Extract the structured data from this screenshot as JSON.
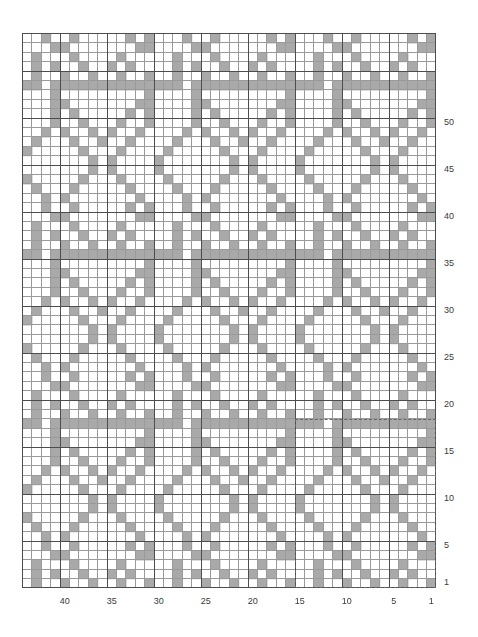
{
  "chart_data": {
    "type": "heatmap",
    "title": "",
    "subtitle": "",
    "xlabel": "",
    "ylabel": "",
    "grid": true,
    "legend_position": "none",
    "columns": 44,
    "rows": 59,
    "x_direction": "right-to-left",
    "y_direction": "bottom-to-top",
    "xlim": [
      1,
      44
    ],
    "ylim": [
      1,
      59
    ],
    "x_tick_labels": [
      "40",
      "35",
      "30",
      "25",
      "20",
      "15",
      "10",
      "5",
      "1"
    ],
    "x_tick_values": [
      40,
      35,
      30,
      25,
      20,
      15,
      10,
      5,
      1
    ],
    "y_tick_labels": [
      "50",
      "45",
      "40",
      "35",
      "30",
      "25",
      "20",
      "15",
      "10",
      "5",
      "1"
    ],
    "y_tick_values": [
      50,
      45,
      40,
      35,
      30,
      25,
      20,
      15,
      10,
      5,
      1
    ],
    "colors": {
      "filled_cell": "#a9a9a9",
      "empty_cell": "#ffffff",
      "cell_border": "#9a9a9a",
      "major_border": "#4d4d4d",
      "repeat_box": "#666666",
      "label_text": "#3a3a3a"
    },
    "cell_size_px": 9.4,
    "major_gridline_every": 5,
    "repeat": {
      "label": "pattern repeat",
      "col_start": 1,
      "col_end": 15,
      "row_start": 1,
      "row_end": 18,
      "width": 15,
      "height": 18,
      "style": "dashed"
    },
    "motif": {
      "width": 15,
      "height": 18,
      "note": "Tile repeated across the chart. Rows listed bottom (row 1) to top (row 18); each string is 15 characters, right-to-left column 1..15 reading left-to-right in the string is column 15..1. '#'=filled, '.'=empty.",
      "rows_bottom_to_top": [
        "#..#..#..#..#..",
        "..#.#..#..#.#..",
        "...#....#...#..",
        "##.......##....",
        "#.#.....#..#...",
        ".#.......#.#...",
        "..#.....#...#..",
        "...#...#.....#.",
        "....#.#.......#",
        "....#.#.......#",
        "...#...#.....#.",
        "..#..#..#...#..",
        ".#..#.#..#.#...",
        "#..#...#..#....",
        "#.#.....#.#....",
        "##.......##....",
        "#.........#....",
        "###########.###"
      ]
    }
  },
  "axes": {
    "right_row_labels": [
      "50",
      "45",
      "40",
      "35",
      "30",
      "25",
      "20",
      "15",
      "10",
      "5",
      "1"
    ],
    "bottom_col_labels": [
      "40",
      "35",
      "30",
      "25",
      "20",
      "15",
      "10",
      "5",
      "1"
    ]
  }
}
